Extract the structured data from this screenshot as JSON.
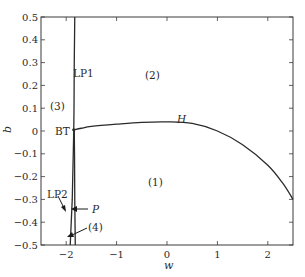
{
  "chart_data": {
    "type": "line",
    "title": "",
    "xlabel": "w",
    "ylabel": "b",
    "xlim": [
      -2.5,
      2.5
    ],
    "ylim": [
      -0.5,
      0.5
    ],
    "grid": false,
    "legend": null,
    "x_ticks": [
      -2,
      -1,
      0,
      1,
      2
    ],
    "x_tick_labels": [
      "−2",
      "−1",
      "0",
      "1",
      "2"
    ],
    "y_ticks": [
      0.5,
      0.4,
      0.3,
      0.2,
      0.1,
      0,
      -0.1,
      -0.2,
      -0.3,
      -0.4,
      -0.5
    ],
    "y_tick_labels": [
      "0.5",
      "0.4",
      "0.3",
      "0.2",
      "0.1",
      "0",
      "−0.1",
      "−0.2",
      "−0.3",
      "−0.4",
      "−0.5"
    ],
    "series": [
      {
        "name": "LP1",
        "description": "Limit point (fold) curve, upper branch",
        "x": [
          -1.83,
          -1.84,
          -1.845,
          -1.85
        ],
        "y": [
          0.5,
          0.3,
          0.1,
          0.005
        ]
      },
      {
        "name": "LP2",
        "description": "Limit point (fold) curve, lower branch",
        "x": [
          -1.85,
          -1.86,
          -1.88,
          -1.9,
          -1.92
        ],
        "y": [
          0.005,
          -0.1,
          -0.3,
          -0.4,
          -0.5
        ]
      },
      {
        "name": "P",
        "description": "Curve close to LP2, lower branch",
        "x": [
          -1.84,
          -1.835,
          -1.83,
          -1.825,
          -1.82
        ],
        "y": [
          0.005,
          -0.1,
          -0.3,
          -0.4,
          -0.5
        ]
      },
      {
        "name": "H",
        "description": "Hopf bifurcation curve",
        "x": [
          -1.85,
          -1.7,
          -1.5,
          -1.0,
          -0.5,
          0.0,
          0.5,
          1.0,
          1.5,
          2.0,
          2.3,
          2.5
        ],
        "y": [
          0.005,
          0.012,
          0.02,
          0.03,
          0.038,
          0.04,
          0.033,
          0.0,
          -0.06,
          -0.15,
          -0.23,
          -0.3
        ]
      }
    ],
    "annotations": [
      {
        "text": "LP1",
        "x": -1.75,
        "y": 0.3
      },
      {
        "text": "(2)",
        "x": -0.15,
        "y": 0.27
      },
      {
        "text": "(3)",
        "x": -2.3,
        "y": 0.1
      },
      {
        "text": "BT",
        "x": -2.15,
        "y": 0.01
      },
      {
        "text": "H",
        "x": 0.65,
        "y": 0.05,
        "italic": true
      },
      {
        "text": "(1)",
        "x": 0.05,
        "y": -0.22
      },
      {
        "text": "LP2",
        "x": -2.25,
        "y": -0.26
      },
      {
        "text": "P",
        "x": -1.45,
        "y": -0.35,
        "italic": true
      },
      {
        "text": "(4)",
        "x": -1.45,
        "y": -0.44
      }
    ]
  },
  "axes": {
    "x_label": "w",
    "y_label": "b"
  },
  "labels": {
    "lp1": "LP1",
    "lp2": "LP2",
    "bt": "BT",
    "h": "H",
    "p": "P",
    "region1": "(1)",
    "region2": "(2)",
    "region3": "(3)",
    "region4": "(4)"
  },
  "ticks": {
    "x": [
      "−2",
      "−1",
      "0",
      "1",
      "2"
    ],
    "y": [
      "0.5",
      "0.4",
      "0.3",
      "0.2",
      "0.1",
      "0",
      "−0.1",
      "−0.2",
      "−0.3",
      "−0.4",
      "−0.5"
    ]
  }
}
